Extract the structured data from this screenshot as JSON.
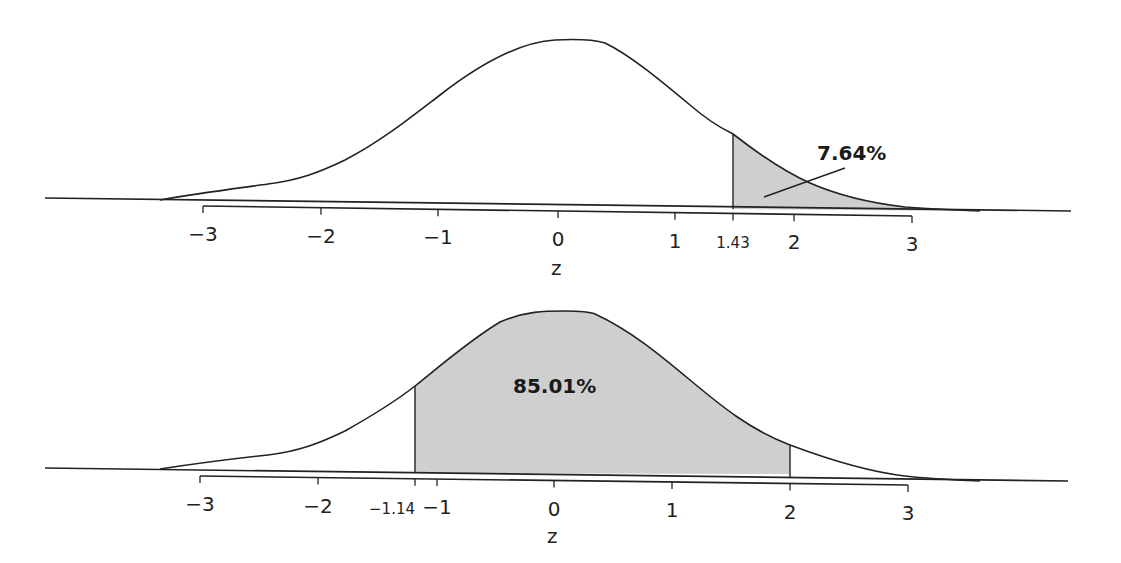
{
  "chart_data": [
    {
      "type": "area",
      "title": "",
      "description": "Standard normal curve with right tail shaded beyond z = 1.43",
      "xlabel": "z",
      "ylabel": "",
      "xlim": [
        -3.6,
        3.6
      ],
      "tick_labels": [
        "−3",
        "−2",
        "−1",
        "0",
        "1",
        "1.43",
        "2",
        "3"
      ],
      "tick_values": [
        -3,
        -2,
        -1,
        0,
        1,
        1.43,
        2,
        3
      ],
      "shaded_region": {
        "from": 1.43,
        "to": "inf"
      },
      "annotation": "7.64%",
      "annotation_value": 7.64,
      "fill_color": "#cfcfcf",
      "line_color": "#222222",
      "grid": false,
      "legend": null
    },
    {
      "type": "area",
      "title": "",
      "description": "Standard normal curve with region between z = -1.14 and z = 2 shaded",
      "xlabel": "z",
      "ylabel": "",
      "xlim": [
        -3.6,
        3.6
      ],
      "tick_labels": [
        "−3",
        "−2",
        "−1.14",
        "−1",
        "0",
        "1",
        "2",
        "3"
      ],
      "tick_values": [
        -3,
        -2,
        -1.14,
        -1,
        0,
        1,
        2,
        3
      ],
      "shaded_region": {
        "from": -1.14,
        "to": 2
      },
      "annotation": "85.01%",
      "annotation_value": 85.01,
      "fill_color": "#cfcfcf",
      "line_color": "#222222",
      "grid": false,
      "legend": null
    }
  ],
  "charts": {
    "top": {
      "axis_title": "z",
      "annotation": "7.64%",
      "ticks": [
        {
          "label": "−3",
          "x": 203,
          "small": false
        },
        {
          "label": "−2",
          "x": 321,
          "small": false
        },
        {
          "label": "−1",
          "x": 438,
          "small": false
        },
        {
          "label": "0",
          "x": 558,
          "small": false
        },
        {
          "label": "1",
          "x": 675,
          "small": false
        },
        {
          "label": "1.43",
          "x": 733,
          "small": true
        },
        {
          "label": "2",
          "x": 794,
          "small": false
        },
        {
          "label": "3",
          "x": 912,
          "small": false
        }
      ]
    },
    "bottom": {
      "axis_title": "z",
      "annotation": "85.01%",
      "ticks": [
        {
          "label": "−3",
          "x": 200,
          "small": false
        },
        {
          "label": "−2",
          "x": 318,
          "small": false
        },
        {
          "label": "−1.14",
          "x": 415,
          "small": true
        },
        {
          "label": "−1",
          "x": 437,
          "small": false
        },
        {
          "label": "0",
          "x": 554,
          "small": false
        },
        {
          "label": "1",
          "x": 672,
          "small": false
        },
        {
          "label": "2",
          "x": 790,
          "small": false
        },
        {
          "label": "3",
          "x": 908,
          "small": false
        }
      ]
    }
  }
}
